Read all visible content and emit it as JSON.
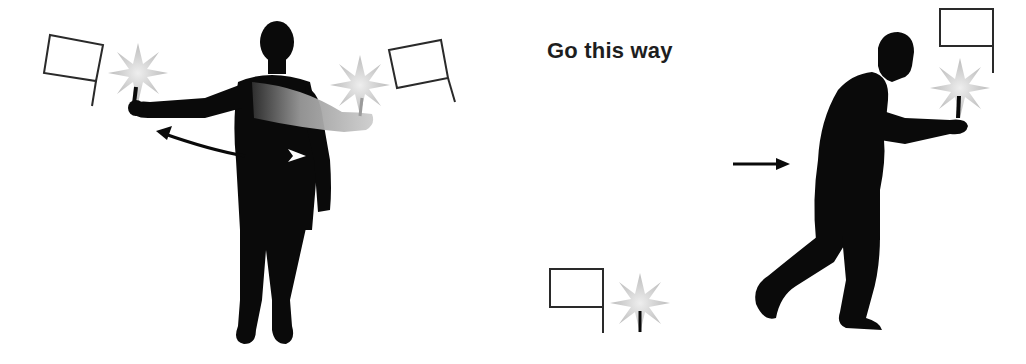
{
  "figure": {
    "caption": "Go this way",
    "colors": {
      "background": "#ffffff",
      "silhouette": "#0a0a0a",
      "flag_outline": "#2a2a2a",
      "flare": "#c8c8c8",
      "motion_arm_start": "#3a3a3a",
      "motion_arm_end": "#c9c9c9"
    },
    "left_panel": {
      "description": "Standing figure with both arms extended holding lit flares; ghost arm and curved arrow indicate swinging one arm across the body",
      "elements": [
        "flag-icon-left",
        "flare-left",
        "flag-icon-right",
        "flare-right",
        "curved-arrow",
        "ghost-arm"
      ]
    },
    "right_panel": {
      "description": "Figure walking forward holding a flare in front; arrow indicates direction of travel",
      "elements": [
        "direction-arrow",
        "flag-icon-top",
        "flare-held",
        "legend-flag",
        "legend-flare"
      ]
    }
  }
}
